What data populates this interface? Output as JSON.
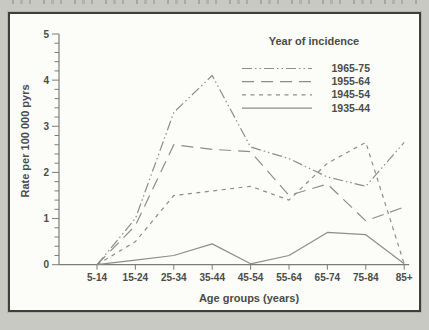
{
  "page": {
    "background_color": "#c8c9c3",
    "panel_background": "#fcfcf9",
    "text_color": "#4c4c48",
    "line_color": "#8d8d89"
  },
  "chart_data": {
    "type": "line",
    "legend_title": "Year of incidence",
    "legend_position": "top-right",
    "xlabel": "Age groups (years)",
    "ylabel": "Rate per 100 000 pyrs",
    "categories": [
      "5-14",
      "15-24",
      "25-34",
      "35-44",
      "45-54",
      "55-64",
      "65-74",
      "75-84",
      "85+"
    ],
    "yticks": [
      "0",
      "1",
      "2",
      "3",
      "4",
      "5"
    ],
    "ylim": [
      0,
      5
    ],
    "y_minor_step": 0.2,
    "grid": false,
    "series": [
      {
        "name": "1965-75",
        "style": "dash-dot-dot",
        "values": [
          0,
          1.0,
          3.3,
          4.1,
          2.55,
          2.3,
          1.9,
          1.7,
          2.65
        ]
      },
      {
        "name": "1955-64",
        "style": "long-dash",
        "values": [
          0,
          0.85,
          2.6,
          2.5,
          2.45,
          1.5,
          1.75,
          0.95,
          1.25
        ]
      },
      {
        "name": "1945-54",
        "style": "short-dash",
        "values": [
          0,
          0.5,
          1.5,
          1.6,
          1.7,
          1.4,
          2.2,
          2.65,
          0.02
        ]
      },
      {
        "name": "1935-44",
        "style": "solid",
        "values": [
          0,
          0.1,
          0.2,
          0.45,
          0.02,
          0.2,
          0.7,
          0.65,
          0.02
        ]
      }
    ]
  }
}
